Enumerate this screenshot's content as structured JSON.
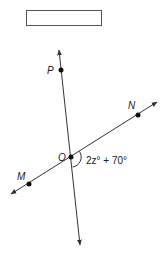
{
  "diagram": {
    "answer_box": {
      "value": ""
    },
    "lines": [
      {
        "name": "line-PO",
        "from": [
          59,
          50
        ],
        "to": [
          80,
          245
        ]
      },
      {
        "name": "line-MN",
        "from": [
          11,
          194
        ],
        "to": [
          157,
          102
        ]
      }
    ],
    "points": [
      {
        "id": "P",
        "label": "P",
        "x": 61,
        "y": 70,
        "label_x": 47,
        "label_y": 74
      },
      {
        "id": "N",
        "label": "N",
        "x": 138,
        "y": 115,
        "label_x": 128,
        "label_y": 109
      },
      {
        "id": "O",
        "label": "O",
        "x": 71,
        "y": 157,
        "label_x": 58,
        "label_y": 161
      },
      {
        "id": "M",
        "label": "M",
        "x": 29,
        "y": 184,
        "label_x": 17,
        "label_y": 180
      }
    ],
    "angle": {
      "label": "2z° + 70°",
      "vertex": "O"
    },
    "colors": {
      "stroke": "#333333",
      "point": "#111111"
    }
  }
}
